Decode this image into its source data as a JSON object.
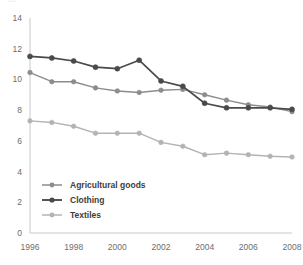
{
  "chart_data": {
    "type": "line",
    "title": "",
    "subtitle": "",
    "xlabel": "",
    "ylabel": "",
    "x": [
      1996,
      1997,
      1998,
      1999,
      2000,
      2001,
      2002,
      2003,
      2004,
      2005,
      2006,
      2007,
      2008
    ],
    "xlim": [
      1996,
      2008
    ],
    "ylim": [
      0,
      14
    ],
    "xticks": [
      "1996",
      "1998",
      "2000",
      "2002",
      "2004",
      "2006",
      "2008"
    ],
    "xtick_values": [
      1996,
      1998,
      2000,
      2002,
      2004,
      2006,
      2008
    ],
    "yticks": [
      "0",
      "2",
      "4",
      "6",
      "8",
      "10",
      "12",
      "14"
    ],
    "ytick_values": [
      0,
      2,
      4,
      6,
      8,
      10,
      12,
      14
    ],
    "grid": false,
    "legend_position": "lower-left-inside",
    "markers": "circle",
    "series": [
      {
        "name": "Agricultural goods",
        "color": "#8c8c8c",
        "values": [
          10.45,
          9.85,
          9.85,
          9.45,
          9.25,
          9.15,
          9.3,
          9.35,
          9.0,
          8.65,
          8.35,
          8.2,
          7.9
        ]
      },
      {
        "name": "Clothing",
        "color": "#4a4a4a",
        "values": [
          11.5,
          11.4,
          11.2,
          10.8,
          10.7,
          11.25,
          9.9,
          9.55,
          8.45,
          8.15,
          8.15,
          8.15,
          8.05
        ]
      },
      {
        "name": "Textiles",
        "color": "#b3b3b3",
        "values": [
          7.3,
          7.2,
          6.95,
          6.5,
          6.5,
          6.5,
          5.9,
          5.65,
          5.1,
          5.2,
          5.1,
          5.0,
          4.95
        ]
      }
    ]
  },
  "legend": {
    "items": [
      {
        "label": "Agricultural goods"
      },
      {
        "label": "Clothing"
      },
      {
        "label": "Textiles"
      }
    ]
  },
  "axes": {
    "axis_color": "#c9c9c9",
    "tick_color": "#6d6d6d"
  },
  "cropped_header": {
    "text": "..."
  }
}
